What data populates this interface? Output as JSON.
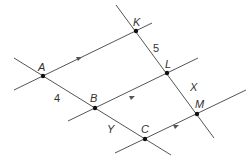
{
  "diagram": {
    "colors": {
      "line": "#555555",
      "point": "#111111",
      "text": "#333333"
    },
    "points": {
      "A": {
        "label": "A",
        "x": 43,
        "y": 76
      },
      "B": {
        "label": "B",
        "x": 95,
        "y": 108
      },
      "C": {
        "label": "C",
        "x": 145,
        "y": 139
      },
      "K": {
        "label": "K",
        "x": 136,
        "y": 31
      },
      "L": {
        "label": "L",
        "x": 167,
        "y": 73
      },
      "M": {
        "label": "M",
        "x": 197,
        "y": 114
      }
    },
    "segment_labels": {
      "AB": "4",
      "KL": "5",
      "LM": "X",
      "BC": "Y"
    },
    "parallel_lines": [
      "AK",
      "BL",
      "CM"
    ],
    "transversals": [
      "A-B-C",
      "K-L-M"
    ]
  }
}
